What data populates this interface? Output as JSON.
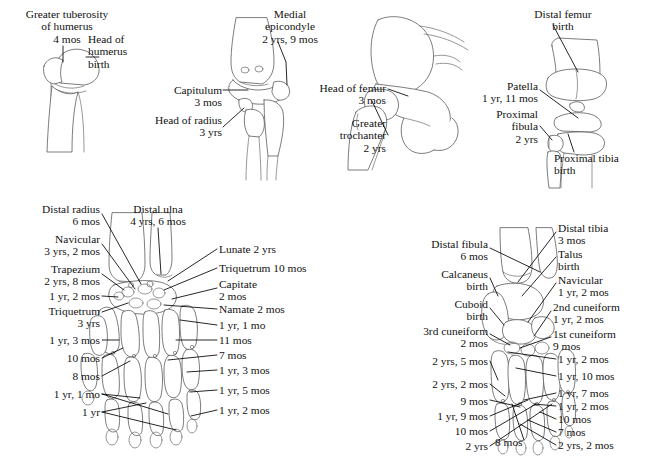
{
  "figure": {
    "background_color": "#ffffff",
    "ink_color": "#111111",
    "bone_outline_color": "#5a5a5a",
    "caption": ""
  },
  "panels": {
    "shoulder": {
      "name": "shoulder",
      "labels": [
        {
          "id": "greater-tuberosity",
          "text": "Greater tuberosity\nof humerus\n4 mos",
          "align": "center",
          "x": 4,
          "y": 8,
          "width": 126
        },
        {
          "id": "head-of-humerus",
          "text": "Head of\nhumerus\nbirth",
          "align": "left",
          "x": 88,
          "y": 33,
          "width": 70
        }
      ]
    },
    "elbow": {
      "name": "elbow",
      "labels": [
        {
          "id": "medial-epicondyle",
          "text": "Medial\nepicondyle\n2 yrs, 9 mos",
          "align": "center",
          "x": 244,
          "y": 8,
          "width": 92
        },
        {
          "id": "capitulum",
          "text": "Capitulum\n3 mos",
          "align": "right",
          "x": 150,
          "y": 84,
          "width": 72
        },
        {
          "id": "head-of-radius",
          "text": "Head of radius\n3 yrs",
          "align": "right",
          "x": 130,
          "y": 114,
          "width": 92
        }
      ]
    },
    "hip": {
      "name": "hip",
      "labels": [
        {
          "id": "head-of-femur",
          "text": "Head of femur\n3 mos",
          "align": "right",
          "x": 296,
          "y": 82,
          "width": 90
        },
        {
          "id": "greater-trochanter",
          "text": "Greater\ntrochanter\n2 yrs",
          "align": "right",
          "x": 300,
          "y": 117,
          "width": 86
        }
      ]
    },
    "knee": {
      "name": "knee",
      "labels": [
        {
          "id": "distal-femur",
          "text": "Distal femur\nbirth",
          "align": "center",
          "x": 518,
          "y": 8,
          "width": 90
        },
        {
          "id": "patella",
          "text": "Patella\n1 yr, 11 mos",
          "align": "right",
          "x": 452,
          "y": 80,
          "width": 86
        },
        {
          "id": "proximal-fibula",
          "text": "Proximal\nfibula\n2 yrs",
          "align": "right",
          "x": 462,
          "y": 108,
          "width": 76
        },
        {
          "id": "proximal-tibia",
          "text": "Proximal tibia\nbirth",
          "align": "left",
          "x": 554,
          "y": 152,
          "width": 90
        }
      ]
    },
    "hand": {
      "name": "hand",
      "left_labels": [
        {
          "id": "distal-radius",
          "text": "Distal radius\n6 mos",
          "align": "right",
          "x": 2,
          "y": 203,
          "width": 98
        },
        {
          "id": "navicular-hand",
          "text": "Navicular\n3 yrs, 2 mos",
          "align": "right",
          "x": 2,
          "y": 233,
          "width": 98
        },
        {
          "id": "trapezium",
          "text": "Trapezium\n2 yrs, 8 mos",
          "align": "right",
          "x": 2,
          "y": 263,
          "width": 98
        },
        {
          "id": "hand-1yr2mos",
          "text": "1 yr, 2 mos",
          "align": "right",
          "x": 2,
          "y": 290,
          "width": 98
        },
        {
          "id": "triquetrum-hand",
          "text": "Triquetrum\n3 yrs",
          "align": "right",
          "x": 2,
          "y": 305,
          "width": 98
        },
        {
          "id": "hand-1yr3mos",
          "text": "1 yr, 3 mos",
          "align": "right",
          "x": 2,
          "y": 334,
          "width": 98
        },
        {
          "id": "hand-10mos",
          "text": "10 mos",
          "align": "right",
          "x": 2,
          "y": 352,
          "width": 98
        },
        {
          "id": "hand-8mos",
          "text": "8 mos",
          "align": "right",
          "x": 2,
          "y": 370,
          "width": 98
        },
        {
          "id": "hand-1yr1mo",
          "text": "1 yr, 1 mo",
          "align": "right",
          "x": 2,
          "y": 388,
          "width": 98
        },
        {
          "id": "hand-1yr",
          "text": "1 yr",
          "align": "right",
          "x": 2,
          "y": 406,
          "width": 98
        }
      ],
      "top_label": {
        "id": "distal-ulna",
        "text": "Distal ulna\n4 yrs, 6 mos",
        "align": "center",
        "x": 112,
        "y": 203,
        "width": 92
      },
      "right_labels": [
        {
          "id": "lunate",
          "text": "Lunate 2 yrs",
          "align": "left",
          "x": 219,
          "y": 243,
          "width": 120
        },
        {
          "id": "triquetrum-right",
          "text": "Triquetrum 10 mos",
          "align": "left",
          "x": 219,
          "y": 262,
          "width": 130
        },
        {
          "id": "capitate",
          "text": "Capitate\n2 mos",
          "align": "left",
          "x": 219,
          "y": 278,
          "width": 120
        },
        {
          "id": "namate",
          "text": "Namate 2 mos",
          "align": "left",
          "x": 219,
          "y": 303,
          "width": 120
        },
        {
          "id": "hand-r-1yr1mo",
          "text": "1 yr, 1 mo",
          "align": "left",
          "x": 219,
          "y": 319,
          "width": 120
        },
        {
          "id": "hand-r-11mos",
          "text": "11 mos",
          "align": "left",
          "x": 219,
          "y": 334,
          "width": 120
        },
        {
          "id": "hand-r-7mos",
          "text": "7 mos",
          "align": "left",
          "x": 219,
          "y": 349,
          "width": 120
        },
        {
          "id": "hand-r-1yr3mos",
          "text": "1 yr, 3 mos",
          "align": "left",
          "x": 219,
          "y": 364,
          "width": 120
        },
        {
          "id": "hand-r-1yr5mos",
          "text": "1 yr, 5 mos",
          "align": "left",
          "x": 219,
          "y": 384,
          "width": 120
        },
        {
          "id": "hand-r-1yr2mos",
          "text": "1 yr, 2 mos",
          "align": "left",
          "x": 219,
          "y": 404,
          "width": 120
        }
      ]
    },
    "foot": {
      "name": "foot",
      "left_labels": [
        {
          "id": "distal-fibula",
          "text": "Distal fibula\n6 mos",
          "align": "right",
          "x": 386,
          "y": 238,
          "width": 102
        },
        {
          "id": "calcaneus",
          "text": "Calcaneus\nbirth",
          "align": "right",
          "x": 386,
          "y": 268,
          "width": 102
        },
        {
          "id": "cuboid",
          "text": "Cuboid\nbirth",
          "align": "right",
          "x": 386,
          "y": 298,
          "width": 102
        },
        {
          "id": "third-cuneiform",
          "text": "3rd cuneiform\n2 mos",
          "align": "right",
          "x": 383,
          "y": 325,
          "width": 105
        },
        {
          "id": "foot-2yrs5mos",
          "text": "2 yrs, 5 mos",
          "align": "right",
          "x": 386,
          "y": 355,
          "width": 102
        },
        {
          "id": "foot-2yrs2mos",
          "text": "2 yrs, 2 mos",
          "align": "right",
          "x": 386,
          "y": 378,
          "width": 102
        },
        {
          "id": "foot-9mos",
          "text": "9 mos",
          "align": "right",
          "x": 386,
          "y": 395,
          "width": 102
        },
        {
          "id": "foot-1yr9mos",
          "text": "1 yr, 9 mos",
          "align": "right",
          "x": 386,
          "y": 410,
          "width": 102
        },
        {
          "id": "foot-10mos",
          "text": "10 mos",
          "align": "right",
          "x": 386,
          "y": 425,
          "width": 102
        },
        {
          "id": "foot-2yrs",
          "text": "2 yrs",
          "align": "right",
          "x": 386,
          "y": 440,
          "width": 102
        }
      ],
      "bottom_label": {
        "id": "foot-8mos",
        "text": "8 mos",
        "align": "left",
        "x": 495,
        "y": 436,
        "width": 50
      },
      "right_labels": [
        {
          "id": "distal-tibia",
          "text": "Distal tibia\n3 mos",
          "align": "left",
          "x": 558,
          "y": 222,
          "width": 88
        },
        {
          "id": "talus",
          "text": "Talus\nbirth",
          "align": "left",
          "x": 558,
          "y": 248,
          "width": 88
        },
        {
          "id": "navicular-foot",
          "text": "Navicular\n1 yr, 2 mos",
          "align": "left",
          "x": 558,
          "y": 274,
          "width": 88
        },
        {
          "id": "second-cuneiform",
          "text": "2nd cuneiform\n1 yr, 2 mos",
          "align": "left",
          "x": 553,
          "y": 301,
          "width": 92
        },
        {
          "id": "first-cuneiform",
          "text": "1st cuneiform\n9 mos",
          "align": "left",
          "x": 553,
          "y": 328,
          "width": 92
        },
        {
          "id": "foot-r-1yr2mos",
          "text": "1 yr, 2 mos",
          "align": "left",
          "x": 558,
          "y": 353,
          "width": 88
        },
        {
          "id": "foot-r-1yr10mos",
          "text": "1 yr, 10 mos",
          "align": "left",
          "x": 558,
          "y": 370,
          "width": 88
        },
        {
          "id": "foot-r-1yr7mos",
          "text": "1 yr, 7 mos",
          "align": "left",
          "x": 558,
          "y": 387,
          "width": 88
        },
        {
          "id": "foot-r-1yr2mos-b",
          "text": "1 yr, 2 mos",
          "align": "left",
          "x": 558,
          "y": 400,
          "width": 88
        },
        {
          "id": "foot-r-10mos",
          "text": "10 mos",
          "align": "left",
          "x": 558,
          "y": 413,
          "width": 88
        },
        {
          "id": "foot-r-7mos",
          "text": "7 mos",
          "align": "left",
          "x": 558,
          "y": 426,
          "width": 88
        },
        {
          "id": "foot-r-2yrs2mos",
          "text": "2 yrs, 2 mos",
          "align": "left",
          "x": 558,
          "y": 439,
          "width": 88
        }
      ]
    }
  }
}
